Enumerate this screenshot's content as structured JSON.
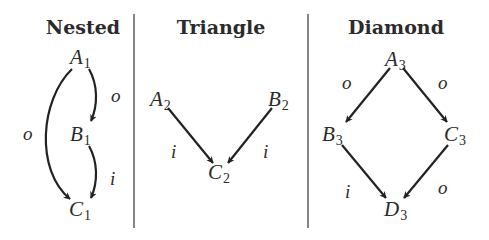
{
  "panels": [
    {
      "title": "Nested",
      "nodes": [
        {
          "id": "A1",
          "letter": "A",
          "sub": "1"
        },
        {
          "id": "B1",
          "letter": "B",
          "sub": "1"
        },
        {
          "id": "C1",
          "letter": "C",
          "sub": "1"
        }
      ],
      "edges": [
        {
          "from": "A1",
          "to": "B1",
          "label": "o"
        },
        {
          "from": "B1",
          "to": "C1",
          "label": "i"
        },
        {
          "from": "A1",
          "to": "C1",
          "label": "o"
        }
      ]
    },
    {
      "title": "Triangle",
      "nodes": [
        {
          "id": "A2",
          "letter": "A",
          "sub": "2"
        },
        {
          "id": "B2",
          "letter": "B",
          "sub": "2"
        },
        {
          "id": "C2",
          "letter": "C",
          "sub": "2"
        }
      ],
      "edges": [
        {
          "from": "A2",
          "to": "C2",
          "label": "i"
        },
        {
          "from": "B2",
          "to": "C2",
          "label": "i"
        }
      ]
    },
    {
      "title": "Diamond",
      "nodes": [
        {
          "id": "A3",
          "letter": "A",
          "sub": "3"
        },
        {
          "id": "B3",
          "letter": "B",
          "sub": "3"
        },
        {
          "id": "C3",
          "letter": "C",
          "sub": "3"
        },
        {
          "id": "D3",
          "letter": "D",
          "sub": "3"
        }
      ],
      "edges": [
        {
          "from": "A3",
          "to": "B3",
          "label": "o"
        },
        {
          "from": "A3",
          "to": "C3",
          "label": "o"
        },
        {
          "from": "B3",
          "to": "D3",
          "label": "i"
        },
        {
          "from": "C3",
          "to": "D3",
          "label": "o"
        }
      ]
    }
  ],
  "colors": {
    "ink": "#222222",
    "background": "#ffffff",
    "divider": "#444444"
  }
}
